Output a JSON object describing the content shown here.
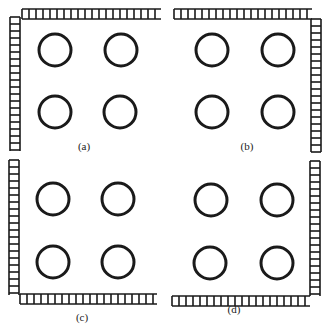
{
  "figure": {
    "colors": {
      "stroke": "#1a1a1a",
      "background": "#ffffff"
    },
    "panels": [
      {
        "id": "a",
        "label": "(a)",
        "label_pos": [
          84,
          150
        ],
        "walls": [
          "top",
          "left"
        ],
        "ladders": [
          {
            "orient": "h",
            "x": 22,
            "y": 9,
            "len": 139
          },
          {
            "orient": "v",
            "x": 10,
            "y": 17,
            "len": 134
          }
        ],
        "circles": [
          [
            55,
            50
          ],
          [
            121,
            50
          ],
          [
            55,
            112
          ],
          [
            120,
            112
          ]
        ]
      },
      {
        "id": "b",
        "label": "(b)",
        "label_pos": [
          247,
          150
        ],
        "walls": [
          "top",
          "right"
        ],
        "ladders": [
          {
            "orient": "h",
            "x": 174,
            "y": 9,
            "len": 138
          },
          {
            "orient": "v",
            "x": 311,
            "y": 19,
            "len": 133
          }
        ],
        "circles": [
          [
            212,
            50
          ],
          [
            278,
            50
          ],
          [
            212,
            112
          ],
          [
            278,
            112
          ]
        ]
      },
      {
        "id": "c",
        "label": "(c)",
        "label_pos": [
          82,
          321
        ],
        "walls": [
          "left",
          "bottom"
        ],
        "ladders": [
          {
            "orient": "v",
            "x": 9,
            "y": 160,
            "len": 135
          },
          {
            "orient": "h",
            "x": 20,
            "y": 294,
            "len": 137
          }
        ],
        "circles": [
          [
            53,
            199
          ],
          [
            118,
            199
          ],
          [
            53,
            262
          ],
          [
            118,
            262
          ]
        ]
      },
      {
        "id": "d",
        "label": "(d)",
        "label_pos": [
          234,
          313
        ],
        "walls": [
          "right",
          "bottom"
        ],
        "ladders": [
          {
            "orient": "v",
            "x": 310,
            "y": 161,
            "len": 135
          },
          {
            "orient": "h",
            "x": 172,
            "y": 296,
            "len": 138
          }
        ],
        "circles": [
          [
            211,
            200
          ],
          [
            277,
            200
          ],
          [
            210,
            263
          ],
          [
            277,
            263
          ]
        ]
      }
    ],
    "circle_radius": 16,
    "ladder_width": 10,
    "rung_spacing": 7
  }
}
